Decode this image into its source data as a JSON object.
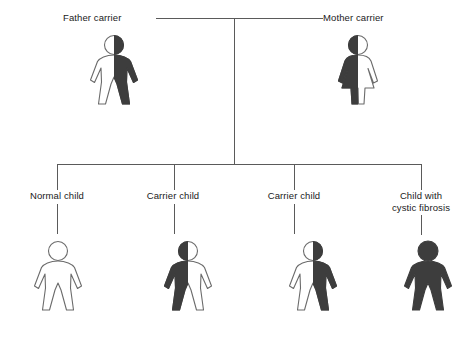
{
  "diagram": {
    "type": "pedigree-chart",
    "topic": "Autosomal recessive inheritance of cystic fibrosis",
    "colors": {
      "affected_fill": "#3d3d3d",
      "unaffected_fill": "#ffffff",
      "outline": "#6b6b6b",
      "connector_line": "#5a5a5a",
      "text": "#1a1a1a"
    },
    "parents": [
      {
        "id": "father",
        "label": "Father carrier",
        "sex": "male",
        "genotype": "carrier",
        "fill_pattern": "half-right",
        "label_x": 63,
        "label_y": 12,
        "figure_x": 86,
        "figure_y": 34
      },
      {
        "id": "mother",
        "label": "Mother carrier",
        "sex": "female",
        "genotype": "carrier",
        "fill_pattern": "half-left",
        "label_x": 323,
        "label_y": 12,
        "figure_x": 330,
        "figure_y": 34
      }
    ],
    "children": [
      {
        "id": "child-1",
        "label": "Normal child",
        "sex": "male",
        "genotype": "normal",
        "fill_pattern": "none",
        "label_x": 12,
        "label_y": 190,
        "figure_x": 30,
        "figure_y": 238,
        "stem_x": 57
      },
      {
        "id": "child-2",
        "label": "Carrier child",
        "sex": "male",
        "genotype": "carrier",
        "fill_pattern": "half-left",
        "label_x": 127,
        "label_y": 190,
        "figure_x": 160,
        "figure_y": 238,
        "stem_x": 174
      },
      {
        "id": "child-3",
        "label": "Carrier child",
        "sex": "male",
        "genotype": "carrier",
        "fill_pattern": "half-right",
        "label_x": 258,
        "label_y": 190,
        "figure_x": 285,
        "figure_y": 238,
        "stem_x": 294
      },
      {
        "id": "child-4",
        "label": "Child with cystic fibrosis",
        "label_line_1": "Child with",
        "label_line_2": "cystic fibrosis",
        "sex": "male",
        "genotype": "affected",
        "fill_pattern": "full",
        "label_x": 381,
        "label_y": 190,
        "figure_x": 400,
        "figure_y": 238,
        "stem_x": 421
      }
    ],
    "connectors": {
      "mating_line": {
        "x": 156,
        "y": 18,
        "width": 167
      },
      "descent_line": {
        "x": 234,
        "y": 18,
        "height": 146
      },
      "sibship_bar": {
        "x": 57,
        "y": 164,
        "width": 365
      },
      "sibling_stem_top_height": 26,
      "sibling_stem_bottom_height": 22
    }
  }
}
